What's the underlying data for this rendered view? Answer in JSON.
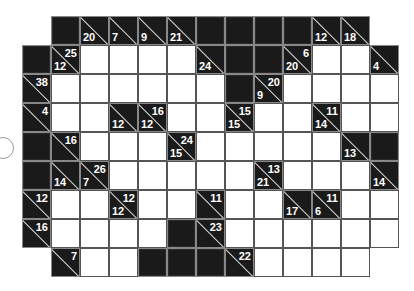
{
  "puzzle": {
    "type": "kakuro",
    "rows": 9,
    "cols": 13,
    "cell_size": 29,
    "cells": [
      [
        null,
        "B",
        {
          "d": 20
        },
        {
          "d": 7
        },
        {
          "d": 9
        },
        {
          "d": 21
        },
        "B",
        "B",
        "B",
        "B",
        {
          "d": 12
        },
        {
          "d": 18
        },
        null
      ],
      [
        "B",
        {
          "a": 25,
          "d": 12
        },
        "W",
        "W",
        "W",
        "W",
        {
          "d": 24
        },
        "B",
        "B",
        {
          "a": 6,
          "d": 20
        },
        "W",
        "W",
        {
          "d": 4
        }
      ],
      [
        {
          "a": 38
        },
        "W",
        "W",
        "W",
        "W",
        "W",
        "W",
        "B",
        {
          "a": 20,
          "d": 9
        },
        "W",
        "W",
        "W",
        "W"
      ],
      [
        {
          "a": 4
        },
        "W",
        "W",
        {
          "d": 12
        },
        {
          "a": 16,
          "d": 12
        },
        "W",
        "W",
        {
          "a": 15,
          "d": 15
        },
        "W",
        "W",
        {
          "a": 11,
          "d": 14
        },
        "W",
        "W"
      ],
      [
        "B",
        {
          "a": 16
        },
        "W",
        "W",
        "W",
        {
          "a": 24,
          "d": 15
        },
        "W",
        "W",
        "W",
        "W",
        "W",
        {
          "d": 13
        },
        "B"
      ],
      [
        "B",
        {
          "d": 14
        },
        {
          "a": 26,
          "d": 7
        },
        "W",
        "W",
        "W",
        "W",
        "W",
        {
          "a": 13,
          "d": 21
        },
        "W",
        "W",
        "W",
        {
          "d": 14
        }
      ],
      [
        {
          "a": 12
        },
        "W",
        "W",
        {
          "a": 12,
          "d": 12
        },
        "W",
        "W",
        {
          "a": 11
        },
        "W",
        "W",
        {
          "d": 17
        },
        {
          "a": 11,
          "d": 6
        },
        "W",
        "W"
      ],
      [
        {
          "a": 16
        },
        "W",
        "W",
        "W",
        "W",
        "B",
        {
          "a": 23
        },
        "W",
        "W",
        "W",
        "W",
        "W",
        "W"
      ],
      [
        null,
        {
          "a": 7
        },
        "W",
        "W",
        "B",
        "B",
        "B",
        {
          "a": 22
        },
        "W",
        "W",
        "W",
        "W",
        null
      ]
    ]
  },
  "decor": {
    "left_circle": true
  }
}
